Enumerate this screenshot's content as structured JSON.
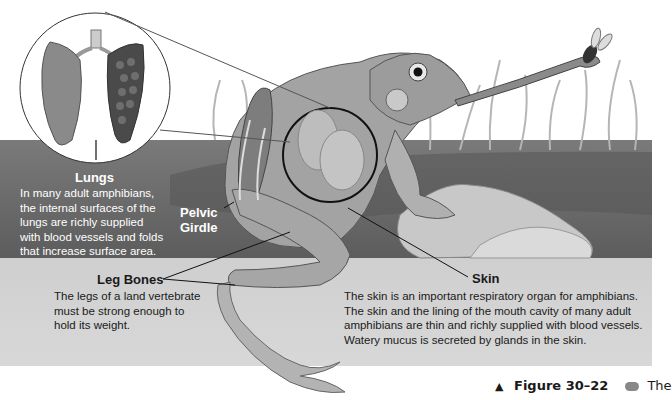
{
  "figure": {
    "number_label": "Figure 30–22",
    "caption_start": "The",
    "caption_marker": "▲",
    "icon": "key-icon"
  },
  "callouts": {
    "lungs": {
      "title": "Lungs",
      "text": [
        "In many adult amphibians,",
        "the internal surfaces of the",
        "lungs are richly supplied",
        "with blood vessels and folds",
        "that increase surface area."
      ]
    },
    "pelvic_girdle": {
      "title_line1": "Pelvic",
      "title_line2": "Girdle"
    },
    "leg_bones": {
      "title": "Leg Bones",
      "text": [
        "The legs of a land vertebrate",
        "must be strong enough to",
        "hold its weight."
      ]
    },
    "skin": {
      "title": "Skin",
      "text": [
        "The skin is an important respiratory organ for amphibians.",
        "The skin and the lining of the mouth cavity of many adult",
        "amphibians are thin and richly supplied with blood vessels.",
        "Watery mucus is secreted by glands in the skin."
      ]
    }
  },
  "illustration": {
    "subject": "frog catching fly with tongue",
    "inset": "lungs-cross-section",
    "colors": {
      "water_dark": "#6e6e6e",
      "water_light": "#d4d4d4",
      "frog_body": "#9a9a9a",
      "label_white": "#ffffff",
      "text_dark": "#1a1a1a"
    }
  }
}
